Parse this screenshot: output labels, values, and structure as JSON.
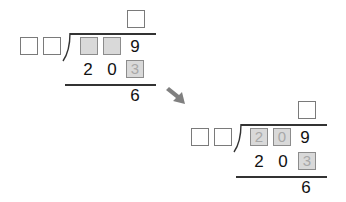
{
  "problems": [
    {
      "quotient": [
        ""
      ],
      "divisor": [
        "",
        ""
      ],
      "dividend": [
        {
          "value": "",
          "filled": true
        },
        {
          "value": "",
          "filled": true
        },
        {
          "value": "9",
          "filled": false
        }
      ],
      "product": [
        {
          "value": "2",
          "filled": false
        },
        {
          "value": "0",
          "filled": false
        },
        {
          "value": "3",
          "filled": true
        }
      ],
      "remainder": "6"
    },
    {
      "quotient": [
        ""
      ],
      "divisor": [
        "",
        ""
      ],
      "dividend": [
        {
          "value": "2",
          "filled": true
        },
        {
          "value": "0",
          "filled": true
        },
        {
          "value": "9",
          "filled": false
        }
      ],
      "product": [
        {
          "value": "2",
          "filled": false
        },
        {
          "value": "0",
          "filled": false
        },
        {
          "value": "3",
          "filled": true
        }
      ],
      "remainder": "6"
    }
  ],
  "arrow": {
    "direction": "down-right",
    "color": "#808080"
  },
  "colors": {
    "filled_box": "#d9d9d9",
    "filled_text": "#a8a8a8",
    "box_border": "#7a7a7a",
    "line": "#333333"
  }
}
